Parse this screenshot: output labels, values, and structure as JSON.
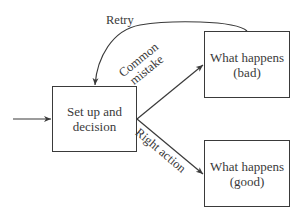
{
  "diagram": {
    "nodes": {
      "setup": {
        "line1": "Set up and",
        "line2": "decision"
      },
      "bad": {
        "line1": "What happens",
        "line2": "(bad)"
      },
      "good": {
        "line1": "What happens",
        "line2": "(good)"
      }
    },
    "edges": {
      "entry": {
        "label": ""
      },
      "retry": {
        "label": "Retry"
      },
      "mistake": {
        "line1": "Common",
        "line2": "mistake"
      },
      "right": {
        "label": "Right action"
      }
    },
    "colors": {
      "stroke": "#3a3a3a",
      "background": "#ffffff"
    }
  }
}
